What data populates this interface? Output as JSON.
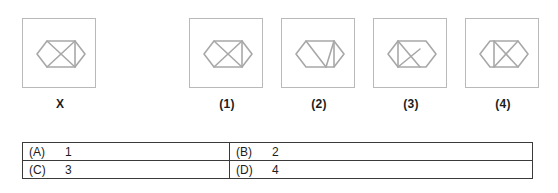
{
  "question": {
    "type": "figure-analogy-multiple-choice",
    "stem_label": "X",
    "figure_stroke_color": "#a8a8a8",
    "box_border_color": "#b9b9b9",
    "table_border_color": "#3a3a3a",
    "text_color": "#1c1c1c"
  },
  "figures": [
    {
      "id": "stem",
      "label": "X",
      "description": "hexagon with internal diagonal lines forming envelope pattern, vertical divider near right"
    },
    {
      "id": "option1",
      "label": "(1)",
      "description": "hexagon with diagonal from upper-left to lower-right and vertical divider near right"
    },
    {
      "id": "option2",
      "label": "(2)",
      "description": "hexagon with two diagonals converging toward lower-centre and vertical divider near right"
    },
    {
      "id": "option3",
      "label": "(3)",
      "description": "hexagon with triangle pointing left and diagonals toward lower-right"
    },
    {
      "id": "option4",
      "label": "(4)",
      "description": "hexagon with crossing diagonals forming X on right half"
    }
  ],
  "options": [
    {
      "key": "(A)",
      "value": "1"
    },
    {
      "key": "(B)",
      "value": "2"
    },
    {
      "key": "(C)",
      "value": "3"
    },
    {
      "key": "(D)",
      "value": "4"
    }
  ],
  "options_grid": {
    "rows": [
      [
        {
          "key": "(A)",
          "value": "1"
        },
        {
          "key": "(B)",
          "value": "2"
        }
      ],
      [
        {
          "key": "(C)",
          "value": "3"
        },
        {
          "key": "(D)",
          "value": "4"
        }
      ]
    ]
  }
}
